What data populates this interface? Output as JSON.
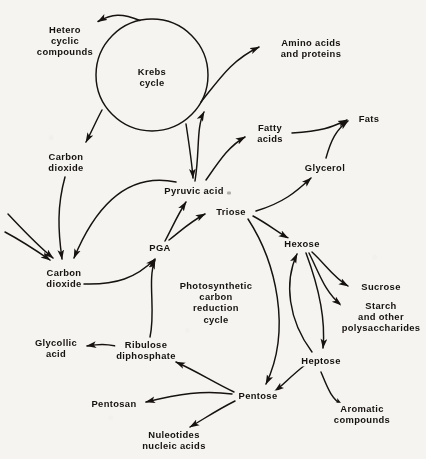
{
  "figure": {
    "kind": "metabolic-pathway-flow-diagram",
    "background_color": "#f5f4f1",
    "ink_color": "#15120f"
  },
  "cycles": [
    {
      "id": "krebs",
      "label": "Krebs\ncycle",
      "cx": 152,
      "cy": 75,
      "r": 56,
      "drawn": "circle"
    },
    {
      "id": "pcr",
      "label": "Photosynthetic\ncarbon\nreduction\ncycle",
      "cx": 216,
      "cy": 302,
      "drawn": "implied"
    }
  ],
  "nodes": [
    {
      "id": "hetero",
      "label": "Hetero\ncyclic\ncompounds",
      "x": 65,
      "y": 41
    },
    {
      "id": "amino",
      "label": "Amino acids\nand proteins",
      "x": 311,
      "y": 48
    },
    {
      "id": "co2_upper",
      "label": "Carbon\ndioxide",
      "x": 66,
      "y": 162
    },
    {
      "id": "fatty",
      "label": "Fatty\nacids",
      "x": 270,
      "y": 133
    },
    {
      "id": "fats",
      "label": "Fats",
      "x": 369,
      "y": 119
    },
    {
      "id": "glycerol",
      "label": "Glycerol",
      "x": 325,
      "y": 168
    },
    {
      "id": "pyruvic",
      "label": "Pyruvic acid",
      "x": 194,
      "y": 191
    },
    {
      "id": "triose",
      "label": "Triose",
      "x": 231,
      "y": 212
    },
    {
      "id": "pga",
      "label": "PGA",
      "x": 160,
      "y": 248
    },
    {
      "id": "hexose",
      "label": "Hexose",
      "x": 302,
      "y": 244
    },
    {
      "id": "co2_lower",
      "label": "Carbon\ndioxide",
      "x": 64,
      "y": 278
    },
    {
      "id": "sucrose",
      "label": "Sucrose",
      "x": 381,
      "y": 287
    },
    {
      "id": "starch",
      "label": "Starch\nand other\npolysaccharides",
      "x": 381,
      "y": 317
    },
    {
      "id": "glycollic",
      "label": "Glycollic\nacid",
      "x": 56,
      "y": 348
    },
    {
      "id": "ribulose",
      "label": "Ribulose\ndiphosphate",
      "x": 146,
      "y": 350
    },
    {
      "id": "heptose",
      "label": "Heptose",
      "x": 321,
      "y": 361
    },
    {
      "id": "pentose",
      "label": "Pentose",
      "x": 258,
      "y": 396
    },
    {
      "id": "pentosan",
      "label": "Pentosan",
      "x": 114,
      "y": 404
    },
    {
      "id": "aromatic",
      "label": "Aromatic\ncompounds",
      "x": 362,
      "y": 414
    },
    {
      "id": "nucleotid",
      "label": "Nuleotides\nnucleic acids",
      "x": 174,
      "y": 440
    }
  ],
  "edges": [
    {
      "from": "krebs",
      "to": "hetero",
      "label": ""
    },
    {
      "from": "krebs",
      "to": "co2_upper",
      "label": ""
    },
    {
      "from": "krebs",
      "to": "amino",
      "label": ""
    },
    {
      "from": "pyruvic",
      "to": "krebs",
      "label": ""
    },
    {
      "from": "krebs",
      "to": "pyruvic",
      "label": ""
    },
    {
      "from": "pyruvic",
      "to": "fatty",
      "label": ""
    },
    {
      "from": "fatty",
      "to": "fats",
      "label": ""
    },
    {
      "from": "glycerol",
      "to": "fats",
      "label": ""
    },
    {
      "from": "triose",
      "to": "glycerol",
      "label": ""
    },
    {
      "from": "co2_upper",
      "to": "co2_lower",
      "label": ""
    },
    {
      "from": "external",
      "to": "co2_lower",
      "label": ""
    },
    {
      "from": "external2",
      "to": "co2_lower",
      "label": ""
    },
    {
      "from": "pyruvic",
      "to": "co2_lower",
      "label": ""
    },
    {
      "from": "pga",
      "to": "pyruvic",
      "label": ""
    },
    {
      "from": "pga",
      "to": "triose",
      "label": ""
    },
    {
      "from": "co2_lower",
      "to": "pga",
      "label": ""
    },
    {
      "from": "ribulose",
      "to": "pga",
      "label": ""
    },
    {
      "from": "triose",
      "to": "hexose",
      "label": ""
    },
    {
      "from": "hexose",
      "to": "sucrose",
      "label": ""
    },
    {
      "from": "hexose",
      "to": "starch",
      "label": ""
    },
    {
      "from": "hexose",
      "to": "heptose",
      "label": ""
    },
    {
      "from": "triose",
      "to": "pentose",
      "label": ""
    },
    {
      "from": "heptose",
      "to": "pentose",
      "label": ""
    },
    {
      "from": "heptose",
      "to": "hexose",
      "label": ""
    },
    {
      "from": "heptose",
      "to": "aromatic",
      "label": ""
    },
    {
      "from": "pentose",
      "to": "ribulose",
      "label": ""
    },
    {
      "from": "pentose",
      "to": "pentosan",
      "label": ""
    },
    {
      "from": "pentose",
      "to": "nucleotid",
      "label": ""
    },
    {
      "from": "glycollic_src",
      "to": "glycollic",
      "label": ""
    }
  ],
  "artifacts": [
    {
      "id": "scan-speck",
      "x": 229,
      "y": 193
    }
  ]
}
